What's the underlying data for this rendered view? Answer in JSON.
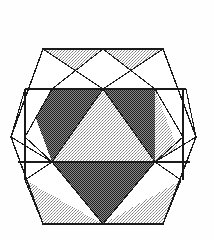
{
  "figure": {
    "type": "geometric-line-drawing",
    "style": "halftone-print-shading",
    "canvas": {
      "width": 214,
      "height": 239
    },
    "background_color": "#ffffff"
  },
  "palette": {
    "line_color": "#1a1a1a",
    "fill_dark": "#6e6e6e",
    "fill_light": "#c9c9c9",
    "fill_white": "#ffffff",
    "halftone_dark_dot": "#2b2b2b",
    "halftone_light_dot": "#8d8d8d"
  },
  "geometry": {
    "outer_hexagon": {
      "name": "outer-hexagon",
      "orientation": "pointy-side",
      "points": "43,49 163,49 196,137 163,224 43,224 11,137",
      "vertices": [
        {
          "label": "top-left",
          "x": 43,
          "y": 49
        },
        {
          "label": "top-right",
          "x": 163,
          "y": 49
        },
        {
          "label": "right",
          "x": 196,
          "y": 137
        },
        {
          "label": "bottom-right",
          "x": 163,
          "y": 224
        },
        {
          "label": "bottom-left",
          "x": 43,
          "y": 224
        },
        {
          "label": "left",
          "x": 11,
          "y": 137
        }
      ]
    },
    "inner_hexagon": {
      "name": "inner-hexagon",
      "points": "52,89 155,89 183,137 155,162 52,162 25,137",
      "vertices": [
        {
          "label": "upper-left",
          "x": 52,
          "y": 89
        },
        {
          "label": "upper-right",
          "x": 155,
          "y": 89
        },
        {
          "label": "mid-right",
          "x": 183,
          "y": 137
        },
        {
          "label": "lower-right",
          "x": 155,
          "y": 162
        },
        {
          "label": "lower-left",
          "x": 52,
          "y": 162
        },
        {
          "label": "mid-left",
          "x": 25,
          "y": 137
        }
      ]
    },
    "band_lines": [
      {
        "name": "upper-band-line",
        "x1": 25,
        "y1": 89,
        "x2": 186,
        "y2": 89
      },
      {
        "name": "lower-band-line",
        "x1": 18,
        "y1": 162,
        "x2": 190,
        "y2": 162
      }
    ],
    "center_point": {
      "x": 103,
      "y": 137
    },
    "apex_top": {
      "x": 103,
      "y": 89
    },
    "apex_bottom": {
      "x": 103,
      "y": 224
    },
    "crossing_top": {
      "x": 103,
      "y": 89
    },
    "crossing_left": {
      "x": 52,
      "y": 162
    },
    "crossing_right": {
      "x": 155,
      "y": 162
    }
  },
  "regions": [
    {
      "name": "center-up-triangle",
      "shade": "light",
      "points": "52,162 155,162 103,89"
    },
    {
      "name": "left-dark-triangle",
      "shade": "dark",
      "points": "52,89 103,89 52,162"
    },
    {
      "name": "left-dark-triangle-lower",
      "shade": "dark",
      "points": "25,137 52,89 52,162"
    },
    {
      "name": "right-dark-triangle",
      "shade": "dark",
      "points": "155,89 103,89 155,162"
    },
    {
      "name": "right-dark-triangle-lower",
      "shade": "dark",
      "points": "183,137 155,89 155,162"
    },
    {
      "name": "bottom-dark-triangle",
      "shade": "dark",
      "points": "52,162 155,162 103,224"
    },
    {
      "name": "top-left-flap",
      "shade": "light",
      "points": "43,49 103,49 52,89"
    },
    {
      "name": "top-right-flap",
      "shade": "light",
      "points": "163,49 103,49 155,89"
    },
    {
      "name": "right-flap",
      "shade": "light",
      "points": "196,137 155,89 155,162"
    },
    {
      "name": "bottom-left-flap",
      "shade": "light",
      "points": "43,224 25,180 103,224"
    },
    {
      "name": "bottom-right-flap",
      "shade": "light",
      "points": "163,224 181,180 103,224"
    },
    {
      "name": "top-left-white-wedge",
      "shade": "white",
      "points": "43,49 52,89 103,89"
    },
    {
      "name": "top-right-white-wedge",
      "shade": "white",
      "points": "163,49 155,89 103,89"
    },
    {
      "name": "left-white-wedge",
      "shade": "white",
      "points": "11,137 25,89 52,162"
    },
    {
      "name": "right-white-wedge",
      "shade": "white",
      "points": "196,137 183,162 155,89"
    },
    {
      "name": "bottom-left-white-wedge",
      "shade": "white",
      "points": "25,180 52,162 103,224"
    },
    {
      "name": "bottom-right-white-wedge",
      "shade": "white",
      "points": "181,180 155,162 103,224"
    }
  ],
  "diagonals": [
    {
      "name": "diag-tl-to-center-apex",
      "x1": 43,
      "y1": 49,
      "x2": 103,
      "y2": 89
    },
    {
      "name": "diag-tr-to-center-apex",
      "x1": 163,
      "y1": 49,
      "x2": 103,
      "y2": 89
    },
    {
      "name": "diag-top-mid-to-ul",
      "x1": 103,
      "y1": 49,
      "x2": 52,
      "y2": 89
    },
    {
      "name": "diag-top-mid-to-ur",
      "x1": 103,
      "y1": 49,
      "x2": 155,
      "y2": 89
    },
    {
      "name": "diag-left-to-ul",
      "x1": 11,
      "y1": 137,
      "x2": 25,
      "y2": 89
    },
    {
      "name": "diag-left-to-ll",
      "x1": 11,
      "y1": 137,
      "x2": 52,
      "y2": 162
    },
    {
      "name": "diag-right-to-ur",
      "x1": 196,
      "y1": 137,
      "x2": 186,
      "y2": 89
    },
    {
      "name": "diag-right-to-lr",
      "x1": 196,
      "y1": 137,
      "x2": 155,
      "y2": 162
    },
    {
      "name": "diag-bl-to-bottom-apex",
      "x1": 43,
      "y1": 224,
      "x2": 103,
      "y2": 224
    },
    {
      "name": "diag-ll-to-bottom-apex",
      "x1": 52,
      "y1": 162,
      "x2": 103,
      "y2": 224
    },
    {
      "name": "diag-lr-to-bottom-apex",
      "x1": 155,
      "y1": 162,
      "x2": 103,
      "y2": 224
    },
    {
      "name": "diag-bl-flap-edge",
      "x1": 43,
      "y1": 224,
      "x2": 25,
      "y2": 180
    },
    {
      "name": "diag-br-flap-edge",
      "x1": 163,
      "y1": 224,
      "x2": 181,
      "y2": 180
    },
    {
      "name": "diag-ll-to-bl-flap",
      "x1": 52,
      "y1": 162,
      "x2": 25,
      "y2": 180
    },
    {
      "name": "diag-lr-to-br-flap",
      "x1": 155,
      "y1": 162,
      "x2": 181,
      "y2": 180
    },
    {
      "name": "diag-ul-down-left",
      "x1": 52,
      "y1": 89,
      "x2": 25,
      "y2": 137
    },
    {
      "name": "diag-ur-down-right",
      "x1": 155,
      "y1": 89,
      "x2": 183,
      "y2": 137
    },
    {
      "name": "diag-ll-up-left",
      "x1": 52,
      "y1": 162,
      "x2": 25,
      "y2": 137
    },
    {
      "name": "diag-lr-up-right",
      "x1": 155,
      "y1": 162,
      "x2": 183,
      "y2": 137
    },
    {
      "name": "diag-apex-to-ll",
      "x1": 103,
      "y1": 89,
      "x2": 52,
      "y2": 162
    },
    {
      "name": "diag-apex-to-lr",
      "x1": 103,
      "y1": 89,
      "x2": 155,
      "y2": 162
    },
    {
      "name": "vert-left-short",
      "x1": 25,
      "y1": 89,
      "x2": 25,
      "y2": 180
    },
    {
      "name": "vert-right-short",
      "x1": 183,
      "y1": 89,
      "x2": 183,
      "y2": 180
    }
  ]
}
